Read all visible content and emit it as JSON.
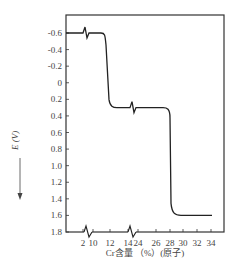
{
  "chart_data": {
    "type": "line",
    "title": "",
    "xlabel": "Cr含量 （%）(原子)",
    "ylabel": "E (V)",
    "ylabel_prefix": "—",
    "y_inverted": true,
    "ylim": [
      -0.6,
      1.8
    ],
    "yticks": [
      "-0.6",
      "-0.4",
      "-0.2",
      "0",
      "0.2",
      "0.4",
      "0.6",
      "0.8",
      "1.0",
      "1.2",
      "1.4",
      "1.6",
      "1.8"
    ],
    "ytick_values": [
      -0.6,
      -0.4,
      -0.2,
      0,
      0.2,
      0.4,
      0.6,
      0.8,
      1.0,
      1.2,
      1.4,
      1.6,
      1.8
    ],
    "xticks": [
      "2",
      "10",
      "12",
      "14",
      "24",
      "26",
      "28",
      "30",
      "32",
      "34"
    ],
    "x_axis_breaks": [
      "between 2 and 10",
      "between 14 and 24"
    ],
    "grid": false,
    "legend": "none",
    "series": [
      {
        "name": "E vs Cr content",
        "points": [
          {
            "x": "2",
            "y": -0.6
          },
          {
            "x": "10",
            "y": -0.6
          },
          {
            "x": "11.5",
            "y": -0.58
          },
          {
            "x": "12",
            "y": -0.4
          },
          {
            "x": "12.5",
            "y": 0.2
          },
          {
            "x": "13",
            "y": 0.3
          },
          {
            "x": "14",
            "y": 0.3
          },
          {
            "x": "24",
            "y": 0.3
          },
          {
            "x": "28",
            "y": 0.3
          },
          {
            "x": "29",
            "y": 0.4
          },
          {
            "x": "29.3",
            "y": 1.5
          },
          {
            "x": "30",
            "y": 1.6
          },
          {
            "x": "34",
            "y": 1.6
          }
        ],
        "plateaus": [
          {
            "range": "2-12",
            "E": -0.6
          },
          {
            "range": "12-28",
            "E": 0.3
          },
          {
            "range": "30-35",
            "E": 1.6
          }
        ]
      }
    ]
  }
}
